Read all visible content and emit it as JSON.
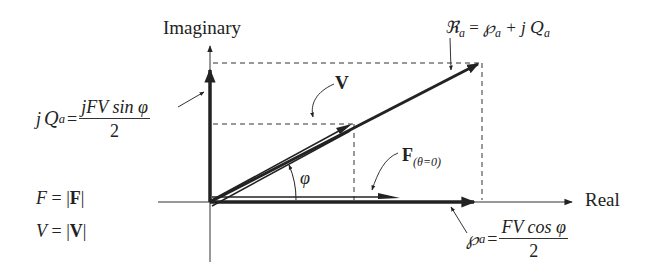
{
  "diagram": {
    "type": "phasor-diagram",
    "axes": {
      "horizontal_label": "Real",
      "vertical_label": "Imaginary"
    },
    "labels": {
      "complex_power": {
        "lhs": "ℜ",
        "lhs_sub": "a",
        "eq": " = ",
        "p": "℘",
        "p_sub": "a",
        "plus": " + j",
        "q": "Q",
        "q_sub": "a"
      },
      "reactive": {
        "lhs_j": "j",
        "lhs": "Q",
        "lhs_sub": "a",
        "eq": " = ",
        "numerator": "jFV sin φ",
        "denominator": "2"
      },
      "active": {
        "lhs": "℘",
        "lhs_sub": "a",
        "eq": " = ",
        "numerator": "FV cos φ",
        "denominator": "2"
      },
      "voltage_vector": "V",
      "force_vector": "F",
      "force_sub": "(θ=0)",
      "angle": "φ",
      "f_def_lhs": "F",
      "f_def_rhs": "= |F|",
      "f_def_rhs_bold": "F",
      "v_def_lhs": "V",
      "v_def_rhs_bold": "V"
    },
    "colors": {
      "ink": "#222222",
      "background": "#ffffff"
    }
  }
}
